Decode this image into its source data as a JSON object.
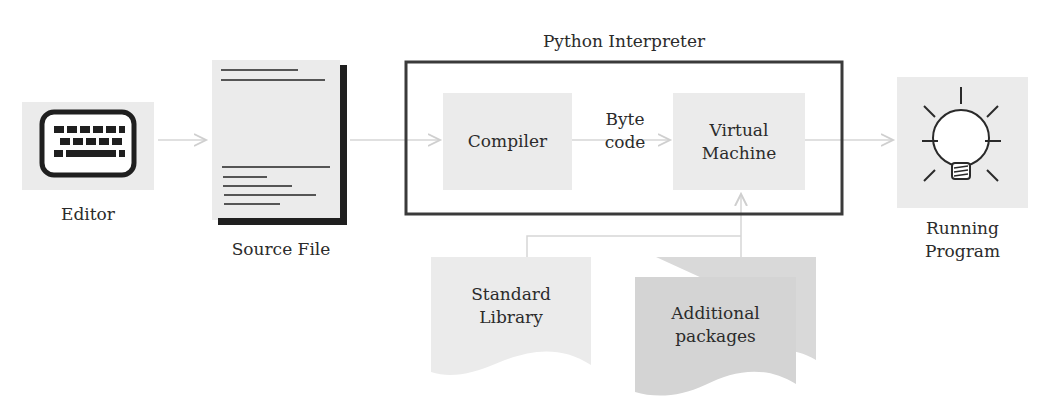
{
  "diagram": {
    "title": "Python Interpreter",
    "nodes": {
      "editor": {
        "label": "Editor",
        "icon": "keyboard-icon"
      },
      "source_file": {
        "label": "Source File",
        "icon": "document-icon"
      },
      "compiler": {
        "label": "Compiler"
      },
      "byte_code": {
        "line1": "Byte",
        "line2": "code"
      },
      "virtual_machine": {
        "line1": "Virtual",
        "line2": "Machine"
      },
      "running_program": {
        "line1": "Running",
        "line2": "Program",
        "icon": "lightbulb-icon"
      },
      "standard_library": {
        "line1": "Standard",
        "line2": "Library"
      },
      "additional_packages": {
        "line1": "Additional",
        "line2": "packages"
      }
    },
    "edges": [
      {
        "from": "Editor",
        "to": "Source File"
      },
      {
        "from": "Source File",
        "to": "Compiler"
      },
      {
        "from": "Compiler",
        "to": "Virtual Machine",
        "label": "Byte code"
      },
      {
        "from": "Virtual Machine",
        "to": "Running Program"
      },
      {
        "from": "Standard Library",
        "to": "Virtual Machine"
      },
      {
        "from": "Additional packages",
        "to": "Virtual Machine"
      }
    ],
    "colors": {
      "box_fill": "#ebebeb",
      "box_fill_dark": "#d6d6d6",
      "stroke": "#2a2a2a",
      "arrow": "#d0d0d0"
    }
  }
}
